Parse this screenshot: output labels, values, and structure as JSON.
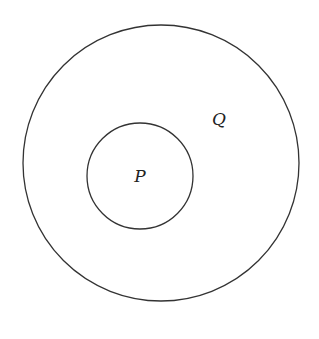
{
  "diagram": {
    "type": "venn-subset",
    "stroke_color": "#333333",
    "background": "#ffffff",
    "sets": [
      {
        "label": "Q",
        "cx": 161,
        "cy": 163,
        "r": 138,
        "label_x": 219,
        "label_y": 125
      },
      {
        "label": "P",
        "cx": 140,
        "cy": 176,
        "r": 53,
        "label_x": 140,
        "label_y": 182
      }
    ]
  }
}
